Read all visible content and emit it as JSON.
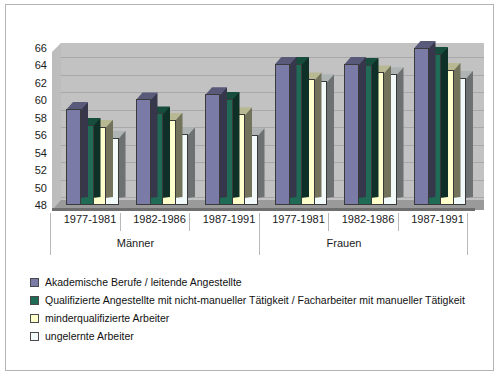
{
  "chart_data": {
    "type": "bar",
    "title": "",
    "subtitle": "",
    "xlabel": "",
    "ylabel": "",
    "ylim": [
      48,
      66
    ],
    "yticks": [
      48,
      50,
      52,
      54,
      56,
      58,
      60,
      62,
      64,
      66
    ],
    "grid": true,
    "legend_position": "bottom-left",
    "categories": [
      "1977-1981",
      "1982-1986",
      "1987-1991",
      "1977-1981",
      "1982-1986",
      "1987-1991"
    ],
    "group_labels": [
      "Männer",
      "Frauen"
    ],
    "groups": [
      {
        "name": "Männer",
        "categories": [
          "1977-1981",
          "1982-1986",
          "1987-1991"
        ]
      },
      {
        "name": "Frauen",
        "categories": [
          "1977-1981",
          "1982-1986",
          "1987-1991"
        ]
      }
    ],
    "series": [
      {
        "name": "Akademische Berufe / leitende Angestellte",
        "color": "#7B7BA8",
        "values": [
          59.0,
          60.1,
          60.7,
          64.2,
          64.2,
          66.0
        ]
      },
      {
        "name": "Qualifizierte Angestellte mit nicht-manueller Tätigkeit / Facharbeiter mit manueller Tätigkeit",
        "color": "#1F6B55",
        "values": [
          57.2,
          58.5,
          60.2,
          64.2,
          64.1,
          65.3
        ]
      },
      {
        "name": "minderqualifizierte Arbeiter",
        "color": "#FFFFCC",
        "values": [
          57.0,
          57.8,
          58.4,
          62.4,
          63.2,
          63.5
        ]
      },
      {
        "name": "ungelernte Arbeiter",
        "color": "#F2FAFA",
        "values": [
          55.7,
          56.1,
          56.0,
          62.2,
          63.0,
          62.6
        ]
      }
    ]
  },
  "legend": {
    "items": [
      {
        "label": "Akademische Berufe / leitende Angestellte",
        "color": "#7B7BA8"
      },
      {
        "label": "Qualifizierte Angestellte mit nicht-manueller Tätigkeit / Facharbeiter mit manueller Tätigkeit",
        "color": "#1F6B55"
      },
      {
        "label": "minderqualifizierte Arbeiter",
        "color": "#FFFFCC"
      },
      {
        "label": "ungelernte Arbeiter",
        "color": "#F2FAFA"
      }
    ]
  }
}
